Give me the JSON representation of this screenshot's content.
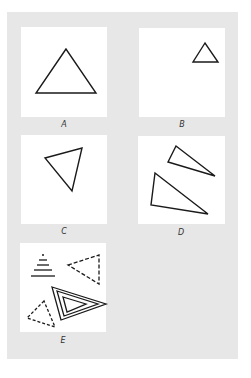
{
  "figure": {
    "background_color": "#e7e7e7",
    "panel_color": "#ffffff",
    "stroke_color": "#1a1a1a",
    "panels": [
      {
        "id": "A",
        "label": "A",
        "description": "large equilateral triangle, centered",
        "shapes": [
          {
            "type": "triangle",
            "style": "solid",
            "points": [
              [
                66,
                49
              ],
              [
                36,
                93
              ],
              [
                96,
                93
              ]
            ]
          }
        ]
      },
      {
        "id": "B",
        "label": "B",
        "description": "small equilateral triangle, upper right",
        "shapes": [
          {
            "type": "triangle",
            "style": "solid",
            "points": [
              [
                205,
                43
              ],
              [
                193,
                62
              ],
              [
                218,
                62
              ]
            ]
          }
        ]
      },
      {
        "id": "C",
        "label": "C",
        "description": "rotated triangle",
        "shapes": [
          {
            "type": "triangle",
            "style": "solid",
            "points": [
              [
                45,
                158
              ],
              [
                82,
                148
              ],
              [
                72,
                191
              ]
            ]
          }
        ]
      },
      {
        "id": "D",
        "label": "D",
        "description": "two obtuse/scalene triangles",
        "shapes": [
          {
            "type": "triangle",
            "style": "solid",
            "points": [
              [
                176,
                146
              ],
              [
                168,
                162
              ],
              [
                215,
                176
              ]
            ]
          },
          {
            "type": "triangle",
            "style": "solid",
            "points": [
              [
                155,
                173
              ],
              [
                151,
                205
              ],
              [
                208,
                214
              ]
            ]
          }
        ]
      },
      {
        "id": "E",
        "label": "E",
        "description": "stacked-lines triangle, dashed triangles, double-outline triangle",
        "shapes": [
          {
            "type": "stacked-lines",
            "style": "solid"
          },
          {
            "type": "triangle",
            "style": "dashed",
            "points": [
              [
                68,
                265
              ],
              [
                99,
                255
              ],
              [
                99,
                284
              ]
            ]
          },
          {
            "type": "triangle",
            "style": "double",
            "points": [
              [
                52,
                287
              ],
              [
                106,
                304
              ],
              [
                61,
                320
              ]
            ]
          },
          {
            "type": "triangle",
            "style": "solid",
            "points": [
              [
                63,
                297
              ],
              [
                86,
                304
              ],
              [
                67,
                312
              ]
            ]
          },
          {
            "type": "triangle",
            "style": "dashed",
            "points": [
              [
                44,
                301
              ],
              [
                27,
                318
              ],
              [
                55,
                327
              ]
            ]
          }
        ]
      }
    ]
  },
  "labels": {
    "a": "A",
    "b": "B",
    "c": "C",
    "d": "D",
    "e": "E"
  }
}
